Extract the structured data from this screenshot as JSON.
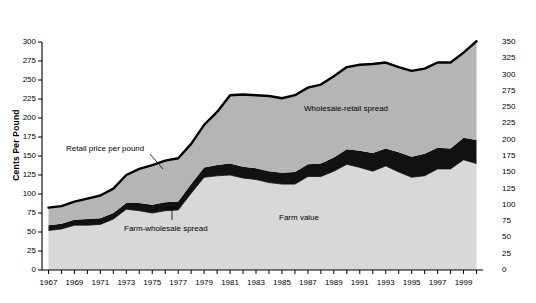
{
  "chart_data": {
    "type": "area",
    "title": "",
    "subtitle": "",
    "xlabel": "",
    "ylabel": "Cents Per Pound",
    "ylabel_right": "",
    "xlim": [
      1966.5,
      2000.5
    ],
    "ylim": [
      0,
      300
    ],
    "ylim_right": [
      0,
      350
    ],
    "grid": false,
    "legend_position": "inline-annotations",
    "y_ticks_left": [
      0,
      25,
      50,
      75,
      100,
      125,
      150,
      175,
      200,
      225,
      250,
      275,
      300
    ],
    "y_ticks_right": [
      0,
      25,
      50,
      75,
      100,
      125,
      150,
      175,
      200,
      225,
      250,
      275,
      300,
      325,
      350
    ],
    "x_ticks": [
      1967,
      1968,
      1969,
      1970,
      1971,
      1972,
      1973,
      1974,
      1975,
      1976,
      1977,
      1978,
      1979,
      1980,
      1981,
      1982,
      1983,
      1984,
      1985,
      1986,
      1987,
      1988,
      1989,
      1990,
      1991,
      1992,
      1993,
      1994,
      1995,
      1996,
      1997,
      1998,
      1999,
      2000
    ],
    "x_tick_labels": [
      "1967",
      "",
      "1969",
      "",
      "1971",
      "",
      "1973",
      "",
      "1975",
      "",
      "1977",
      "",
      "1979",
      "",
      "1981",
      "",
      "1983",
      "",
      "1985",
      "",
      "1987",
      "",
      "1989",
      "",
      "1991",
      "",
      "1993",
      "",
      "1995",
      "",
      "1997",
      "",
      "1999",
      ""
    ],
    "x": [
      1967,
      1968,
      1969,
      1970,
      1971,
      1972,
      1973,
      1974,
      1975,
      1976,
      1977,
      1978,
      1979,
      1980,
      1981,
      1982,
      1983,
      1984,
      1985,
      1986,
      1987,
      1988,
      1989,
      1990,
      1991,
      1992,
      1993,
      1994,
      1995,
      1996,
      1997,
      1998,
      1999,
      2000
    ],
    "series": [
      {
        "name": "Farm value",
        "color": "#d8d8d8",
        "values": [
          52,
          54,
          59,
          59,
          60,
          67,
          80,
          78,
          75,
          78,
          79,
          101,
          122,
          124,
          125,
          121,
          119,
          115,
          113,
          113,
          123,
          123,
          130,
          139,
          135,
          130,
          137,
          129,
          122,
          124,
          133,
          133,
          145,
          140
        ]
      },
      {
        "name": "Farm-wholesale spread",
        "color": "#111111",
        "values": [
          7,
          7,
          7,
          8,
          8,
          8,
          8,
          10,
          11,
          11,
          11,
          12,
          13,
          14,
          15,
          15,
          15,
          15,
          15,
          16,
          16,
          17,
          18,
          20,
          22,
          24,
          23,
          26,
          27,
          29,
          28,
          27,
          29,
          31
        ]
      },
      {
        "name": "Wholesale-retail spread",
        "color": "#b5b5b5",
        "values": [
          23,
          23,
          24,
          27,
          30,
          32,
          37,
          45,
          52,
          55,
          57,
          53,
          56,
          70,
          90,
          95,
          96,
          99,
          98,
          101,
          101,
          104,
          107,
          108,
          113,
          117,
          113,
          112,
          113,
          112,
          112,
          113,
          112,
          130
        ]
      }
    ],
    "top_line": {
      "name": "Retail price per pound",
      "color": "#000000",
      "values": [
        82,
        84,
        90,
        94,
        98,
        107,
        125,
        133,
        138,
        144,
        147,
        166,
        191,
        208,
        230,
        231,
        230,
        229,
        226,
        230,
        240,
        244,
        255,
        267,
        270,
        271,
        273,
        267,
        262,
        265,
        273,
        273,
        286,
        301
      ]
    },
    "annotations": [
      {
        "text": "Retail price per pound",
        "x_px": 66,
        "y_px": 144
      },
      {
        "text": "Farm-wholesale spread",
        "x_px": 124,
        "y_px": 224
      },
      {
        "text": "Wholesale-retail spread",
        "x_px": 304,
        "y_px": 104
      },
      {
        "text": "Farm value",
        "x_px": 279,
        "y_px": 213
      }
    ]
  },
  "axes": {
    "left_title": "Cents Per Pound"
  }
}
